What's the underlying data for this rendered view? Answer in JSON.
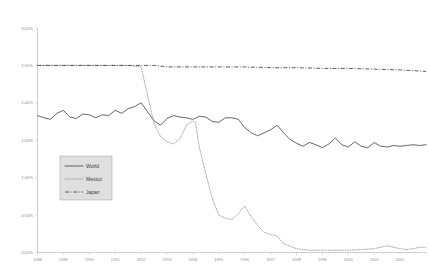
{
  "chart_data": {
    "type": "line",
    "title": "",
    "xlabel": "",
    "ylabel": "",
    "ylim": [
      0.0,
      3.0
    ],
    "ytick_format": "percent",
    "yticks": [
      0.0,
      0.5,
      1.0,
      1.5,
      2.0,
      2.5,
      3.0
    ],
    "ytick_labels": [
      "0.00%",
      "0.50%",
      "1.00%",
      "1.50%",
      "2.00%",
      "2.50%",
      "3.00%"
    ],
    "grid": false,
    "legend_position": "center-left",
    "xlim": [
      1988.0,
      2003.0
    ],
    "xticks": [
      1988,
      1989,
      1990,
      1991,
      1992,
      1993,
      1994,
      1995,
      1996,
      1997,
      1998,
      1999,
      2000,
      2001,
      2002
    ],
    "xtick_labels": [
      "1988",
      "1989",
      "1990",
      "1991",
      "1992",
      "1993",
      "1994",
      "1995",
      "1996",
      "1997",
      "1998",
      "1999",
      "2000",
      "2001",
      "2002"
    ],
    "series": [
      {
        "name": "World",
        "style": "solid",
        "color": "#4a4a4a",
        "x": [
          1988.0,
          1988.25,
          1988.5,
          1988.75,
          1989.0,
          1989.25,
          1989.5,
          1989.75,
          1990.0,
          1990.25,
          1990.5,
          1990.75,
          1991.0,
          1991.25,
          1991.5,
          1991.75,
          1992.0,
          1992.25,
          1992.5,
          1992.75,
          1993.0,
          1993.25,
          1993.5,
          1993.75,
          1994.0,
          1994.25,
          1994.5,
          1994.75,
          1995.0,
          1995.25,
          1995.5,
          1995.75,
          1996.0,
          1996.25,
          1996.5,
          1996.75,
          1997.0,
          1997.25,
          1997.5,
          1997.75,
          1998.0,
          1998.25,
          1998.5,
          1998.75,
          1999.0,
          1999.25,
          1999.5,
          1999.75,
          2000.0,
          2000.25,
          2000.5,
          2000.75,
          2001.0,
          2001.25,
          2001.5,
          2001.75,
          2002.0,
          2002.25,
          2002.5,
          2002.75,
          2003.0
        ],
        "values": [
          1.83,
          1.8,
          1.78,
          1.86,
          1.9,
          1.81,
          1.79,
          1.85,
          1.84,
          1.8,
          1.84,
          1.83,
          1.9,
          1.86,
          1.92,
          1.95,
          2.0,
          1.88,
          1.76,
          1.7,
          1.79,
          1.83,
          1.81,
          1.8,
          1.78,
          1.82,
          1.81,
          1.75,
          1.74,
          1.8,
          1.8,
          1.78,
          1.67,
          1.6,
          1.56,
          1.6,
          1.64,
          1.7,
          1.6,
          1.51,
          1.46,
          1.42,
          1.47,
          1.44,
          1.4,
          1.45,
          1.53,
          1.44,
          1.41,
          1.48,
          1.42,
          1.4,
          1.47,
          1.42,
          1.41,
          1.43,
          1.42,
          1.43,
          1.44,
          1.43,
          1.44
        ]
      },
      {
        "name": "Mexico",
        "style": "dotted",
        "color": "#9a9a9a",
        "x": [
          1988.0,
          1988.5,
          1989.0,
          1989.5,
          1990.0,
          1990.5,
          1991.0,
          1991.5,
          1992.0,
          1992.25,
          1992.5,
          1992.75,
          1993.0,
          1993.25,
          1993.5,
          1993.75,
          1994.0,
          1994.1,
          1994.25,
          1994.5,
          1994.75,
          1995.0,
          1995.25,
          1995.5,
          1995.75,
          1996.0,
          1996.25,
          1996.5,
          1996.75,
          1997.0,
          1997.25,
          1997.5,
          1998.0,
          1998.5,
          1999.0,
          1999.5,
          2000.0,
          2000.5,
          2001.0,
          2001.25,
          2001.5,
          2001.75,
          2002.0,
          2002.25,
          2002.5,
          2002.75,
          2003.0
        ],
        "values": [
          2.5,
          2.5,
          2.5,
          2.5,
          2.5,
          2.5,
          2.5,
          2.5,
          2.48,
          2.1,
          1.72,
          1.55,
          1.48,
          1.45,
          1.52,
          1.7,
          1.76,
          1.74,
          1.4,
          1.05,
          0.72,
          0.5,
          0.46,
          0.44,
          0.52,
          0.62,
          0.48,
          0.36,
          0.27,
          0.24,
          0.22,
          0.12,
          0.05,
          0.03,
          0.03,
          0.03,
          0.03,
          0.04,
          0.05,
          0.07,
          0.09,
          0.07,
          0.05,
          0.04,
          0.05,
          0.07,
          0.07
        ]
      },
      {
        "name": "Japan",
        "style": "dash-dot",
        "color": "#3d3d3d",
        "x": [
          1988.0,
          1989.0,
          1990.0,
          1991.0,
          1992.0,
          1992.5,
          1993.0,
          1994.0,
          1995.0,
          1996.0,
          1997.0,
          1998.0,
          1999.0,
          2000.0,
          2001.0,
          2002.0,
          2002.5,
          2003.0
        ],
        "values": [
          2.5,
          2.5,
          2.5,
          2.5,
          2.5,
          2.5,
          2.48,
          2.48,
          2.48,
          2.48,
          2.47,
          2.47,
          2.46,
          2.46,
          2.45,
          2.44,
          2.43,
          2.42
        ]
      }
    ]
  },
  "legend": {
    "items": [
      {
        "label": "World",
        "style": "solid"
      },
      {
        "label": "Mexico",
        "style": "dotted"
      },
      {
        "label": "Japan",
        "style": "dash-dot"
      }
    ]
  }
}
